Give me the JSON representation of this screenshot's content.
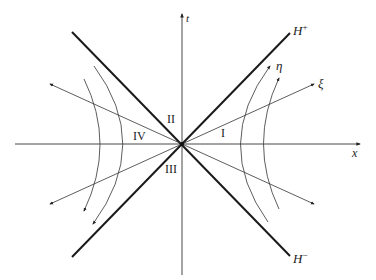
{
  "diagram": {
    "axes": {
      "horizontal_label": "x",
      "vertical_label": "t"
    },
    "horizons": {
      "future": {
        "base": "H",
        "sup": "+"
      },
      "past": {
        "base": "H",
        "sup": "−"
      }
    },
    "coordinate_labels": {
      "eta": "η",
      "xi": "ξ"
    },
    "regions": {
      "right": "I",
      "top": "II",
      "bottom": "III",
      "left": "IV"
    },
    "colors": {
      "stroke": "#222222",
      "horizon": "#1a1a1a",
      "background": "#ffffff"
    }
  }
}
